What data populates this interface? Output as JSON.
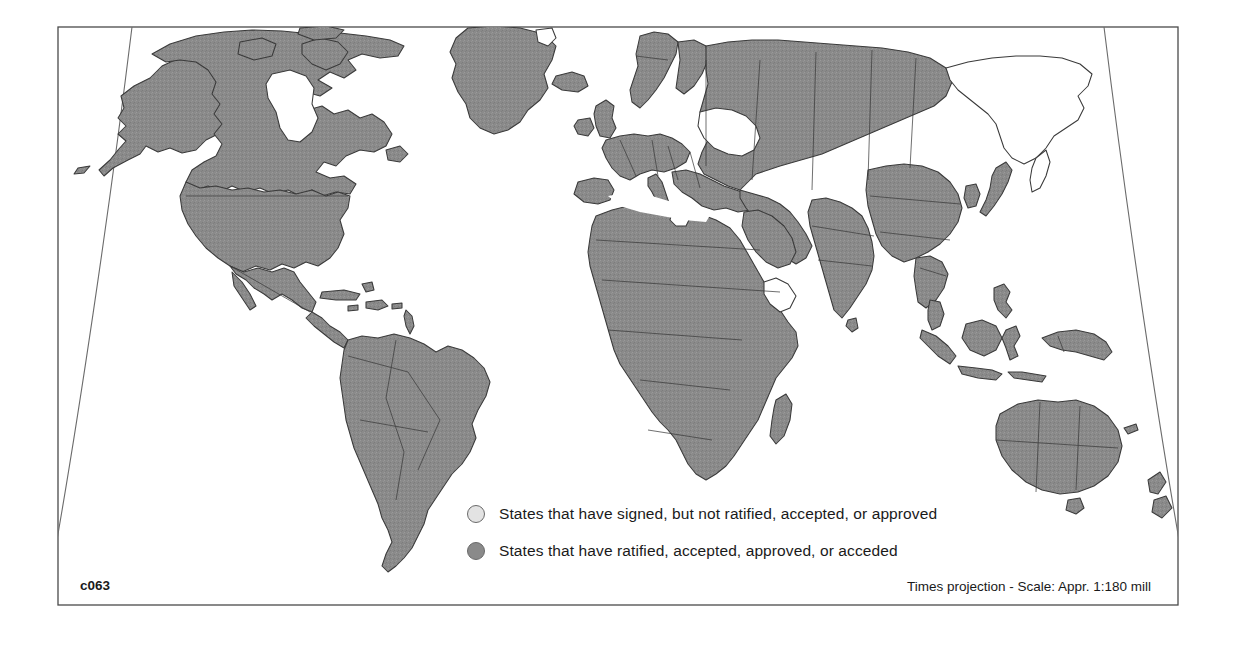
{
  "figure": {
    "code_label": "c063",
    "projection_note": "Times projection - Scale: Appr. 1:180 mill",
    "type": "world-choropleth-map"
  },
  "legend": {
    "items": [
      {
        "swatch_color": "#e3e3e3",
        "label": "States that have signed, but not ratified, accepted, or approved"
      },
      {
        "swatch_color": "#8a8a8a",
        "label": "States that have ratified, accepted, approved, or acceded"
      }
    ]
  },
  "colors": {
    "land_ratified": "#8a8a8a",
    "land_signed": "#e3e3e3",
    "land_none": "#ffffff",
    "border_stroke": "#3a3a3a",
    "frame_stroke": "#4a4a4a",
    "graticule_stroke": "#6b6b6b",
    "background": "#ffffff"
  },
  "map_extent": {
    "frame_left": 58,
    "frame_top": 27,
    "frame_right": 1178,
    "frame_bottom": 605
  }
}
